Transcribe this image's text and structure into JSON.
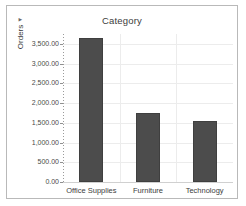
{
  "chart_data": {
    "type": "bar",
    "title": "Category",
    "xlabel": "",
    "ylabel": "Orders",
    "ylabel_sort_indicator": "▼",
    "categories": [
      "Office Supplies",
      "Furniture",
      "Technology"
    ],
    "values": [
      3650,
      1760,
      1550
    ],
    "ylim": [
      0,
      3750
    ],
    "ytick_values": [
      0,
      500,
      1000,
      1500,
      2000,
      2500,
      3000,
      3500
    ],
    "ytick_labels": [
      "0.00",
      "500.00",
      "1,000.00",
      "1,500.00",
      "2,000.00",
      "2,500.00",
      "3,000.00",
      "3,500.00"
    ],
    "grid": true,
    "grid_orientation": "both",
    "legend": false,
    "bar_color": "#4c4c4c",
    "gridline_color": "#ececec",
    "axis_color": "#9a9a9a",
    "border_color": "#b9b9b9",
    "background": "#ffffff"
  }
}
